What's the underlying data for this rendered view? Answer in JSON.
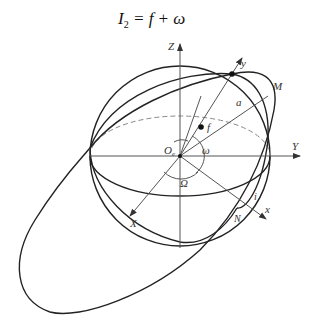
{
  "title": {
    "lhs": "I",
    "lhs_sub": "2",
    "rhs": " = f + ω"
  },
  "labels": {
    "Z": "Z",
    "Y": "Y",
    "X": "X",
    "y": "y",
    "x": "x",
    "M": "M",
    "a": "a",
    "f": "f",
    "omega": "ω",
    "Omega": "Ω",
    "origin": "O",
    "origin_sub": "e",
    "i": "i",
    "N": "N"
  },
  "colors": {
    "curve": "#222222",
    "axis": "#555555",
    "dashed": "#888888"
  }
}
